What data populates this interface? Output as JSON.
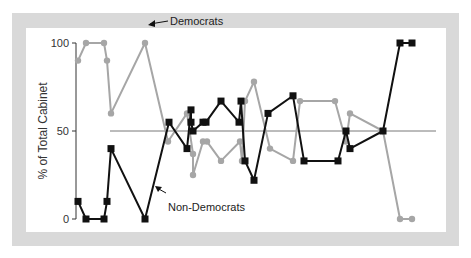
{
  "chart_data": {
    "type": "line",
    "title": "",
    "xlabel": "",
    "ylabel": "% of Total Cabinet",
    "ylim": [
      0,
      100
    ],
    "yticks": [
      0,
      50,
      100
    ],
    "grid": false,
    "reference_line": {
      "y": 50
    },
    "legend": "inline annotations",
    "series": [
      {
        "name": "Democrats",
        "color": "#a6a6a6",
        "marker": "circle",
        "x": [
          78,
          86,
          104,
          107,
          111,
          145,
          168,
          187,
          193,
          193,
          203,
          207,
          221,
          240,
          242,
          245,
          254,
          270,
          293,
          300,
          335,
          346,
          350,
          383,
          400,
          412
        ],
        "values": [
          90,
          100,
          100,
          90,
          60,
          100,
          44,
          60,
          37,
          25,
          44,
          44,
          33,
          44,
          33,
          67,
          78,
          40,
          33,
          67,
          67,
          44,
          60,
          50,
          0,
          0
        ]
      },
      {
        "name": "Non-Democrats",
        "color": "#111111",
        "marker": "square",
        "x": [
          78,
          86,
          104,
          107,
          111,
          145,
          169,
          187,
          191,
          191,
          193,
          203,
          206,
          221,
          239,
          241,
          245,
          254,
          268,
          293,
          304,
          338,
          346,
          350,
          383,
          400,
          412
        ],
        "values": [
          10,
          0,
          0,
          10,
          40,
          0,
          55,
          40,
          62,
          55,
          50,
          55,
          55,
          67,
          55,
          67,
          33,
          22,
          60,
          70,
          33,
          33,
          50,
          40,
          50,
          100,
          100
        ]
      }
    ],
    "annotations": [
      {
        "text": "Democrats",
        "x": 172,
        "y": 24
      },
      {
        "text": "Non-Democrats",
        "x": 170,
        "y": 208
      }
    ]
  },
  "axis": {
    "ylabel": "% of Total Cabinet",
    "ticks": [
      "100",
      "50",
      "0"
    ]
  },
  "labels": {
    "democrats": "Democrats",
    "non_democrats": "Non-Democrats"
  }
}
